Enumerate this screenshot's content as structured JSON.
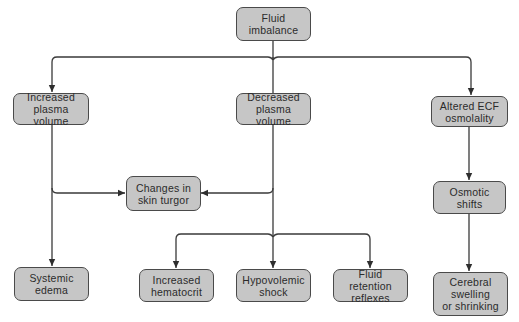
{
  "diagram": {
    "type": "flowchart",
    "colors": {
      "node_fill": "#c6c6c6",
      "node_border": "#4a4a4a",
      "connector": "#3a3a3a",
      "text": "#2b2b2b"
    },
    "nodes": {
      "root": {
        "label": "Fluid\nimbalance"
      },
      "increased_plasma": {
        "label": "Increased\nplasma volume"
      },
      "decreased_plasma": {
        "label": "Decreased\nplasma volume"
      },
      "altered_ecf": {
        "label": "Altered ECF\nosmolality"
      },
      "skin_turgor": {
        "label": "Changes in\nskin turgor"
      },
      "osmotic_shifts": {
        "label": "Osmotic\nshifts"
      },
      "systemic_edema": {
        "label": "Systemic\nedema"
      },
      "increased_hematocrit": {
        "label": "Increased\nhematocrit"
      },
      "hypovolemic_shock": {
        "label": "Hypovolemic\nshock"
      },
      "fluid_retention": {
        "label": "Fluid retention\nreflexes"
      },
      "cerebral": {
        "label": "Cerebral\nswelling\nor shrinking"
      }
    },
    "edges": [
      {
        "from": "Fluid imbalance",
        "to": "Increased plasma volume"
      },
      {
        "from": "Fluid imbalance",
        "to": "Decreased plasma volume"
      },
      {
        "from": "Fluid imbalance",
        "to": "Altered ECF osmolality"
      },
      {
        "from": "Increased plasma volume",
        "to": "Changes in skin turgor"
      },
      {
        "from": "Increased plasma volume",
        "to": "Systemic edema"
      },
      {
        "from": "Decreased plasma volume",
        "to": "Changes in skin turgor"
      },
      {
        "from": "Decreased plasma volume",
        "to": "Increased hematocrit"
      },
      {
        "from": "Decreased plasma volume",
        "to": "Hypovolemic shock"
      },
      {
        "from": "Decreased plasma volume",
        "to": "Fluid retention reflexes"
      },
      {
        "from": "Altered ECF osmolality",
        "to": "Osmotic shifts"
      },
      {
        "from": "Osmotic shifts",
        "to": "Cerebral swelling or shrinking"
      }
    ]
  }
}
